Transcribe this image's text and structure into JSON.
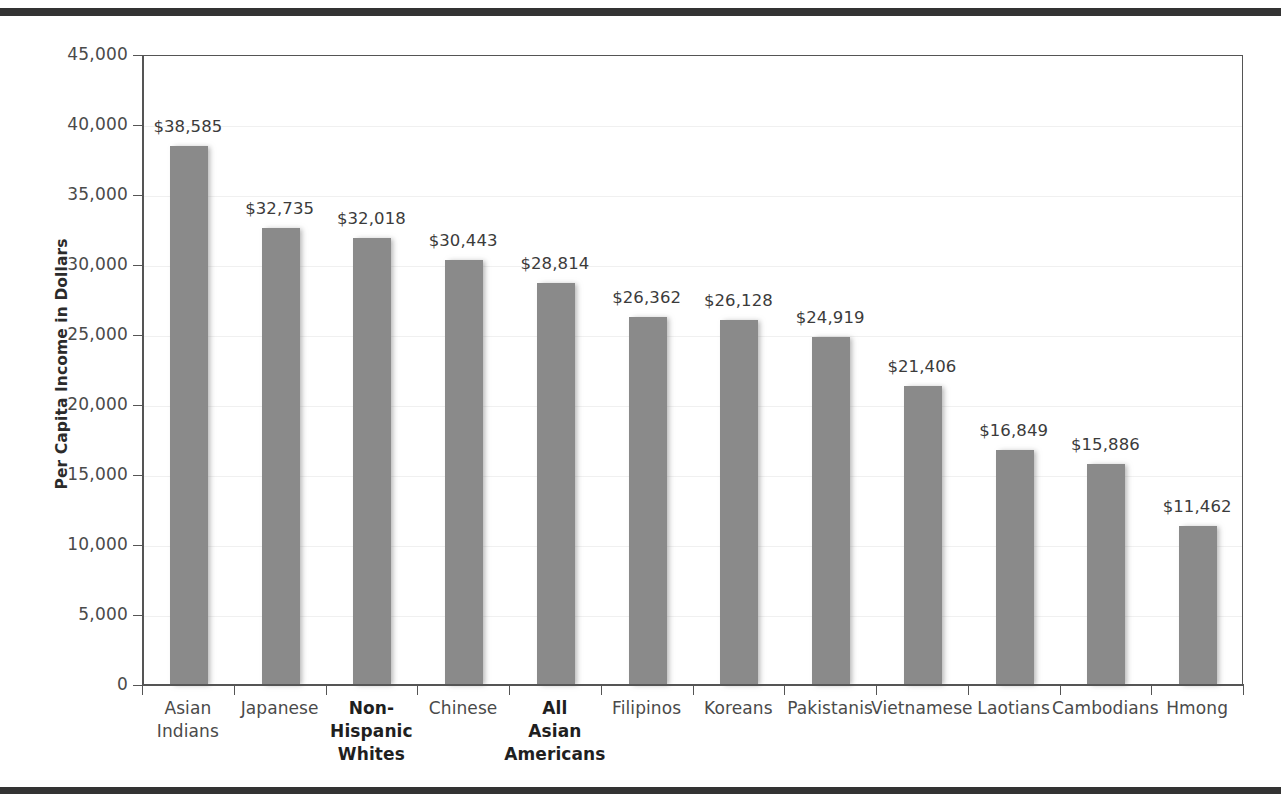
{
  "decor": {
    "top_rule_color": "#333333",
    "bottom_rule_color": "#333333"
  },
  "chart_data": {
    "type": "bar",
    "title": "",
    "xlabel": "",
    "ylabel": "Per Capita Income in Dollars",
    "ylim": [
      0,
      45000
    ],
    "ytick_step": 5000,
    "grid": true,
    "legend": "none",
    "bar_color": "#8a8a8a",
    "categories": [
      "Asian\nIndians",
      "Japanese",
      "Non-\nHispanic\nWhites",
      "Chinese",
      "All\nAsian\nAmericans",
      "Filipinos",
      "Koreans",
      "Pakistanis",
      "Vietnamese",
      "Laotians",
      "Cambodians",
      "Hmong"
    ],
    "category_emphasis": [
      false,
      false,
      true,
      false,
      true,
      false,
      false,
      false,
      false,
      false,
      false,
      false
    ],
    "values": [
      38585,
      32735,
      32018,
      30443,
      28814,
      26362,
      26128,
      24919,
      21406,
      16849,
      15886,
      11462
    ],
    "value_labels": [
      "$38,585",
      "$32,735",
      "$32,018",
      "$30,443",
      "$28,814",
      "$26,362",
      "$26,128",
      "$24,919",
      "$21,406",
      "$16,849",
      "$15,886",
      "$11,462"
    ],
    "ytick_labels": [
      "45,000",
      "40,000",
      "35,000",
      "30,000",
      "25,000",
      "20,000",
      "15,000",
      "10,000",
      "5,000",
      "0"
    ],
    "ytick_values": [
      45000,
      40000,
      35000,
      30000,
      25000,
      20000,
      15000,
      10000,
      5000,
      0
    ]
  }
}
